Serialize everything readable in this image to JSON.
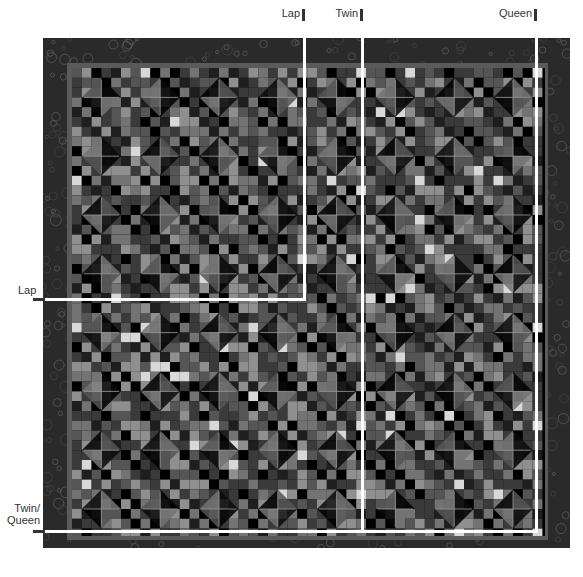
{
  "diagram": {
    "size_markers": {
      "top": [
        {
          "label": "Lap",
          "x": 304
        },
        {
          "label": "Twin",
          "x": 362
        },
        {
          "label": "Queen",
          "x": 536
        }
      ],
      "left": [
        {
          "label": "Lap",
          "y": 299
        },
        {
          "label": "Twin/ Queen",
          "y": 531
        }
      ]
    },
    "labels": {
      "top_lap": "Lap",
      "top_twin": "Twin",
      "top_queen": "Queen",
      "left_lap": "Lap",
      "left_twin": "Twin/",
      "left_queen": "Queen"
    },
    "colors": {
      "outer_border": "#2a2a2a",
      "inner_border": "#5a5a5a",
      "background_patch": "#000000",
      "marker_line": "#ffffff",
      "tick": "#333333",
      "palette": [
        "#000000",
        "#1e1e1e",
        "#3a3a3a",
        "#555555",
        "#737373",
        "#8f8f8f",
        "#b0b0b0",
        "#d8d8d8"
      ]
    },
    "grid": {
      "cell_px": 9.8,
      "block_cells": 6,
      "cols": 48,
      "rows": 48
    }
  }
}
